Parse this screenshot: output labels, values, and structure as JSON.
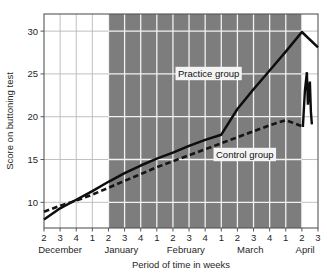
{
  "chart_data": {
    "type": "line",
    "title": "",
    "xlabel": "Period of time in weeks",
    "ylabel": "Score on buttoning test",
    "ylim": [
      7,
      32
    ],
    "xlim": [
      0,
      16
    ],
    "grid": true,
    "legend_position": "inline-annotations",
    "y_ticks": [
      10,
      15,
      20,
      25,
      30
    ],
    "y_tick_labels": [
      "10",
      "15",
      "20",
      "25",
      "30"
    ],
    "x_tick_labels": [
      "2",
      "3",
      "4",
      "1",
      "2",
      "3",
      "4",
      "1",
      "2",
      "3",
      "4",
      "1",
      "2",
      "3",
      "4",
      "1",
      "2",
      "3"
    ],
    "x_group_labels": [
      "December",
      "January",
      "February",
      "March",
      "April"
    ],
    "shaded_region": {
      "label": "treatment period",
      "start_tick_index": 4,
      "end_tick_index": 16,
      "color": "#7d7d7d"
    },
    "series": [
      {
        "name": "Practice group",
        "style": "solid",
        "color": "#0d0d0d",
        "annotation": "Practice group",
        "x": [
          0,
          1,
          2,
          3,
          4,
          5,
          6,
          7,
          8,
          9,
          10,
          11,
          12,
          13,
          14,
          15,
          16,
          17
        ],
        "values": [
          8.0,
          9.3,
          10.3,
          11.3,
          12.4,
          13.4,
          14.3,
          15.1,
          15.8,
          16.6,
          17.3,
          17.9,
          20.9,
          23.2,
          25.4,
          27.6,
          29.9,
          28.1
        ]
      },
      {
        "name": "Control group",
        "style": "dashed",
        "color": "#141414",
        "annotation": "Control group",
        "x": [
          0,
          1,
          2,
          3,
          4,
          5,
          6,
          7,
          8,
          9,
          10,
          11,
          12,
          13,
          14,
          15,
          16
        ],
        "values": [
          8.9,
          9.6,
          10.2,
          10.9,
          11.7,
          12.5,
          13.3,
          14.1,
          14.8,
          15.5,
          16.2,
          16.9,
          17.6,
          18.3,
          19.0,
          19.6,
          18.9
        ]
      }
    ],
    "annotations": [
      {
        "text": "Practice group",
        "x_px": 178,
        "y_px": 77
      },
      {
        "text": "Control group",
        "x_px": 216,
        "y_px": 158
      }
    ]
  },
  "axes": {
    "y_title": "Score on buttoning test",
    "x_title": "Period of time in weeks"
  }
}
